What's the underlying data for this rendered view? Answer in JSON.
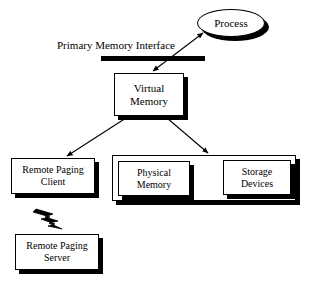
{
  "diagram": {
    "background_color": "#ffffff",
    "stroke_color": "#000000",
    "shadow_color": "#000000",
    "nodes": {
      "process": {
        "label": "Process",
        "shape": "ellipse"
      },
      "virtual_memory": {
        "label_line1": "Virtual",
        "label_line2": "Memory",
        "shape": "rect"
      },
      "remote_paging_client": {
        "label_line1": "Remote Paging",
        "label_line2": "Client",
        "shape": "rect"
      },
      "remote_paging_server": {
        "label_line1": "Remote Paging",
        "label_line2": "Server",
        "shape": "rect"
      },
      "physical_memory": {
        "label_line1": "Physical",
        "label_line2": "Memory",
        "shape": "rect"
      },
      "storage_devices": {
        "label_line1": "Storage",
        "label_line2": "Devices",
        "shape": "rect"
      },
      "local_storage_container": {
        "label": "",
        "shape": "rect"
      }
    },
    "labels": {
      "primary_memory_interface": "Primary Memory Interface"
    },
    "connectors": {
      "process_to_virtual_memory": {
        "type": "double-arrow",
        "from": "process",
        "to": "virtual_memory"
      },
      "virtual_memory_to_remote_paging_client": {
        "type": "arrow",
        "from": "virtual_memory",
        "to": "remote_paging_client"
      },
      "virtual_memory_to_local_storage": {
        "type": "arrow",
        "from": "virtual_memory",
        "to": "local_storage_container"
      },
      "client_to_server_wireless": {
        "type": "lightning-bolt",
        "from": "remote_paging_client",
        "to": "remote_paging_server"
      }
    }
  }
}
